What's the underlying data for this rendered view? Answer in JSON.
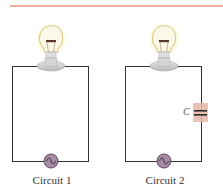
{
  "header": {
    "rule_color": "#e0593a"
  },
  "colors": {
    "wire": "#333333",
    "bulb_glow": "#f7f0a8",
    "bulb_glass": "#fbf8e8",
    "bulb_outline": "#c9b86a",
    "filament": "#5a3a2a",
    "base": "#cfcfcf",
    "ac_source_fill": "#a88aa6",
    "ac_source_stroke": "#5a4a5a",
    "capacitor_bg": "#e8b8a8"
  },
  "circuits": [
    {
      "label": "Circuit 1",
      "has_capacitor": false
    },
    {
      "label": "Circuit 2",
      "has_capacitor": true,
      "capacitor_label": "C"
    }
  ]
}
